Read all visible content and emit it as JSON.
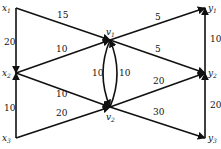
{
  "diagram": {
    "type": "flow-network",
    "nodes": [
      {
        "id": "x1",
        "label": "x",
        "sub": "1",
        "x": 16,
        "y": 8,
        "lx": 2,
        "ly": 11
      },
      {
        "id": "x2",
        "label": "x",
        "sub": "2",
        "x": 16,
        "y": 73,
        "lx": 2,
        "ly": 76
      },
      {
        "id": "x3",
        "label": "x",
        "sub": "3",
        "x": 16,
        "y": 138,
        "lx": 2,
        "ly": 141
      },
      {
        "id": "v1",
        "label": "v",
        "sub": "1",
        "x": 110,
        "y": 40,
        "lx": 106,
        "ly": 35
      },
      {
        "id": "v2",
        "label": "v",
        "sub": "2",
        "x": 110,
        "y": 107,
        "lx": 106,
        "ly": 120
      },
      {
        "id": "y1",
        "label": "y",
        "sub": "1",
        "x": 205,
        "y": 8,
        "lx": 208,
        "ly": 11
      },
      {
        "id": "y2",
        "label": "y",
        "sub": "2",
        "x": 205,
        "y": 73,
        "lx": 208,
        "ly": 76
      },
      {
        "id": "y3",
        "label": "y",
        "sub": "3",
        "x": 205,
        "y": 138,
        "lx": 208,
        "ly": 141
      }
    ],
    "edges": [
      {
        "from": "x1",
        "to": "v1",
        "capacity": "15",
        "lx": 57,
        "ly": 18
      },
      {
        "from": "x1",
        "to": "x2",
        "capacity": "20",
        "lx": 4,
        "ly": 45
      },
      {
        "from": "x2",
        "to": "v1",
        "capacity": "10",
        "lx": 56,
        "ly": 52
      },
      {
        "from": "x2",
        "to": "v2",
        "capacity": "10",
        "lx": 56,
        "ly": 97
      },
      {
        "from": "x3",
        "to": "x2",
        "capacity": "10",
        "lx": 4,
        "ly": 111
      },
      {
        "from": "x3",
        "to": "v2",
        "capacity": "20",
        "lx": 56,
        "ly": 116
      },
      {
        "from": "v1",
        "to": "v2",
        "capacity": "10",
        "lx": 92,
        "ly": 76
      },
      {
        "from": "v2",
        "to": "v1",
        "capacity": "10",
        "lx": 119,
        "ly": 76
      },
      {
        "from": "v1",
        "to": "y1",
        "capacity": "5",
        "lx": 155,
        "ly": 20
      },
      {
        "from": "v1",
        "to": "y2",
        "capacity": "5",
        "lx": 155,
        "ly": 52
      },
      {
        "from": "v2",
        "to": "y2",
        "capacity": "20",
        "lx": 153,
        "ly": 84
      },
      {
        "from": "v2",
        "to": "y3",
        "capacity": "30",
        "lx": 153,
        "ly": 115
      },
      {
        "from": "y2",
        "to": "y1",
        "capacity": "10",
        "lx": 210,
        "ly": 42
      },
      {
        "from": "y3",
        "to": "y2",
        "capacity": "20",
        "lx": 210,
        "ly": 108
      }
    ]
  }
}
